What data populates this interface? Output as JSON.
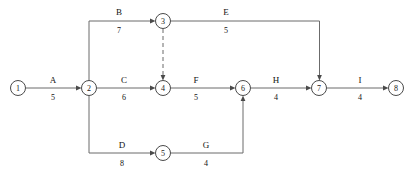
{
  "diagram": {
    "type": "aoa-network",
    "stroke_color": "#6b6b6b",
    "node_stroke_color": "#4a4a4a",
    "text_color": "#111111",
    "background": "#ffffff"
  },
  "nodes": [
    {
      "id": "1",
      "label": "1",
      "x": 18,
      "y": 88,
      "r": 7.5
    },
    {
      "id": "2",
      "label": "2",
      "x": 89,
      "y": 88,
      "r": 7.5
    },
    {
      "id": "3",
      "label": "3",
      "x": 163,
      "y": 21,
      "r": 7.5
    },
    {
      "id": "4",
      "label": "4",
      "x": 163,
      "y": 88,
      "r": 7.5
    },
    {
      "id": "5",
      "label": "5",
      "x": 163,
      "y": 153,
      "r": 7.5
    },
    {
      "id": "6",
      "label": "6",
      "x": 243,
      "y": 88,
      "r": 7.5
    },
    {
      "id": "7",
      "label": "7",
      "x": 319,
      "y": 88,
      "r": 7.5
    },
    {
      "id": "8",
      "label": "8",
      "x": 396,
      "y": 88,
      "r": 7.5
    }
  ],
  "edges": [
    {
      "id": "A",
      "name": "A",
      "duration": "5",
      "from": "1",
      "to": "2",
      "dashed": false,
      "label_x": 53,
      "name_y": 80,
      "dur_y": 98
    },
    {
      "id": "B",
      "name": "B",
      "duration": "7",
      "from": "2",
      "to": "3",
      "dashed": false,
      "label_x": 119,
      "name_y": 12,
      "dur_y": 31
    },
    {
      "id": "C",
      "name": "C",
      "duration": "6",
      "from": "2",
      "to": "4",
      "dashed": false,
      "label_x": 124,
      "name_y": 80,
      "dur_y": 98
    },
    {
      "id": "D",
      "name": "D",
      "duration": "8",
      "from": "2",
      "to": "5",
      "dashed": false,
      "label_x": 122,
      "name_y": 145,
      "dur_y": 164
    },
    {
      "id": "E",
      "name": "E",
      "duration": "5",
      "from": "3",
      "to": "7",
      "dashed": false,
      "label_x": 226,
      "name_y": 12,
      "dur_y": 31
    },
    {
      "id": "F",
      "name": "F",
      "duration": "5",
      "from": "4",
      "to": "6",
      "dashed": false,
      "label_x": 196,
      "name_y": 80,
      "dur_y": 98
    },
    {
      "id": "G",
      "name": "G",
      "duration": "4",
      "from": "5",
      "to": "6",
      "dashed": false,
      "label_x": 206,
      "name_y": 145,
      "dur_y": 164
    },
    {
      "id": "H",
      "name": "H",
      "duration": "4",
      "from": "6",
      "to": "7",
      "dashed": false,
      "label_x": 276,
      "name_y": 80,
      "dur_y": 98
    },
    {
      "id": "I",
      "name": "I",
      "duration": "4",
      "from": "7",
      "to": "8",
      "dashed": false,
      "label_x": 360,
      "name_y": 80,
      "dur_y": 98
    },
    {
      "id": "dummy-3-4",
      "name": "",
      "duration": "",
      "from": "3",
      "to": "4",
      "dashed": true,
      "label_x": 0,
      "name_y": 0,
      "dur_y": 0
    }
  ]
}
